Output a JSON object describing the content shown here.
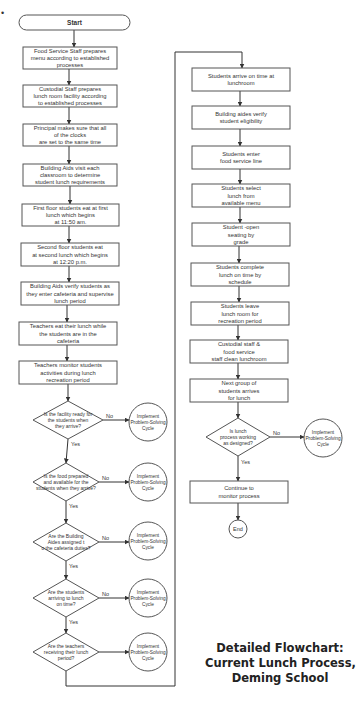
{
  "title": {
    "lines": [
      "Detailed Flowchart:",
      "Current Lunch Process,",
      "Deming School"
    ]
  },
  "flowchart": {
    "start": "Start",
    "end": "End",
    "left_column": [
      {
        "id": "p1",
        "type": "process",
        "lines": [
          "Food Service Staff prepares",
          "menu according to established",
          "processes"
        ]
      },
      {
        "id": "p2",
        "type": "process",
        "lines": [
          "Custodial Staff prepares",
          "lunch room facility according",
          "to established processes"
        ]
      },
      {
        "id": "p3",
        "type": "process",
        "lines": [
          "Principal makes sure that all",
          "of the clocks",
          "are set to the same time"
        ]
      },
      {
        "id": "p4",
        "type": "process",
        "lines": [
          "Building Aids visit each",
          "classroom to determine",
          "student lunch requirements"
        ]
      },
      {
        "id": "p5",
        "type": "process",
        "lines": [
          "First floor students eat at first",
          "lunch which begins",
          "at 11:50 am."
        ]
      },
      {
        "id": "p6",
        "type": "process",
        "lines": [
          "Second floor students eat",
          "at second lunch which begins",
          "at 12:20 p.m."
        ]
      },
      {
        "id": "p7",
        "type": "process",
        "lines": [
          "Building Aids verify students as",
          "they enter cafeteria and supervise",
          "lunch period"
        ]
      },
      {
        "id": "p8",
        "type": "process",
        "lines": [
          "Teachers eat their lunch while",
          "the students are in the",
          "cafeteria"
        ]
      },
      {
        "id": "p9",
        "type": "process",
        "lines": [
          "Teachers monitor students",
          "activities during lunch",
          "recreation period"
        ]
      }
    ],
    "decisions": [
      {
        "id": "d1",
        "lines": [
          "Is the facility ready for",
          "the students when",
          "they arrive?"
        ],
        "no": "No",
        "yes": "Yes",
        "no_target": [
          "Implement",
          "Problem-Solving",
          "Cycle"
        ]
      },
      {
        "id": "d2",
        "lines": [
          "Is the food prepared",
          "and available for the",
          "students when they arrive?"
        ],
        "no": "No",
        "yes": "Yes",
        "no_target": [
          "Implement",
          "Problem-Solving",
          "Cycle"
        ]
      },
      {
        "id": "d3",
        "lines": [
          "Are the Building",
          "Aides assigned t",
          "o the cafeteria duties?"
        ],
        "no": "No",
        "yes": "Yes",
        "no_target": [
          "Implement",
          "Problem-Solving",
          "Cycle"
        ]
      },
      {
        "id": "d4",
        "lines": [
          "Are the students",
          "arriving to lunch",
          "on time?"
        ],
        "no": "No",
        "yes": "Yes",
        "no_target": [
          "Implement",
          "Problem-Solving",
          "Cycle"
        ]
      },
      {
        "id": "d5",
        "lines": [
          "Are the teachers",
          "receiving their lunch",
          "period?"
        ],
        "no": "",
        "yes": "",
        "no_target": [
          "Implement",
          "Problem-Solving",
          "Cycle"
        ]
      }
    ],
    "right_column": [
      {
        "id": "r1",
        "type": "process",
        "lines": [
          "Students arrive on time at",
          "lunchroom"
        ]
      },
      {
        "id": "r2",
        "type": "process",
        "lines": [
          "Building aides verify",
          "student eligibility"
        ]
      },
      {
        "id": "r3",
        "type": "process",
        "lines": [
          "Students enter",
          "food service line"
        ]
      },
      {
        "id": "r4",
        "type": "process",
        "lines": [
          "Students select",
          "lunch from",
          "available menu"
        ]
      },
      {
        "id": "r5",
        "type": "process",
        "lines": [
          "Student -open",
          "seating by",
          "grade"
        ]
      },
      {
        "id": "r6",
        "type": "process",
        "lines": [
          "Students complete",
          "lunch on time by",
          "schedule"
        ]
      },
      {
        "id": "r7",
        "type": "process",
        "lines": [
          "Students leave",
          "lunch room for",
          "recreation period"
        ]
      },
      {
        "id": "r8",
        "type": "process",
        "lines": [
          "Custodial staff &",
          "food service",
          "staff clean lunchroom"
        ]
      },
      {
        "id": "r9",
        "type": "process",
        "lines": [
          "Next group of",
          "students arrives",
          "for lunch"
        ]
      }
    ],
    "final_decision": {
      "id": "d6",
      "lines": [
        "Is lunch",
        "process working",
        "as designed?"
      ],
      "no": "No",
      "yes": "Yes",
      "no_target": [
        "Implement",
        "Problem-Solving",
        "Cycle"
      ]
    },
    "final_process": {
      "id": "r10",
      "lines": [
        "Continue to",
        "monitor process"
      ]
    }
  }
}
